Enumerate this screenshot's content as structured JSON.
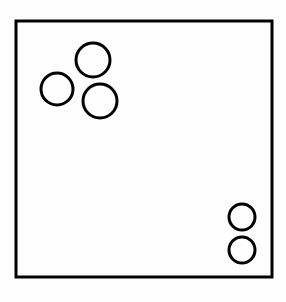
{
  "figure": {
    "canvas": {
      "width": 286,
      "height": 302,
      "background_color": "#fefefe"
    },
    "stroke_color": "#000000",
    "fill_color": "none",
    "container": {
      "shape_name": "square-outline",
      "x": 16,
      "y": 21,
      "width": 256,
      "height": 256,
      "stroke_width": 3
    },
    "groups": [
      {
        "group_name": "upper-left-cluster",
        "count": 3,
        "radius_label": "large"
      },
      {
        "group_name": "lower-right-pair",
        "count": 2,
        "radius_label": "small"
      }
    ],
    "circles": [
      {
        "id": "circle-1",
        "group": "upper-left-cluster",
        "cx": 93,
        "cy": 60,
        "r": 17,
        "stroke_width": 3
      },
      {
        "id": "circle-2",
        "group": "upper-left-cluster",
        "cx": 57,
        "cy": 89,
        "r": 16,
        "stroke_width": 3
      },
      {
        "id": "circle-3",
        "group": "upper-left-cluster",
        "cx": 100,
        "cy": 101,
        "r": 17,
        "stroke_width": 3
      },
      {
        "id": "circle-4",
        "group": "lower-right-pair",
        "cx": 242,
        "cy": 217,
        "r": 13,
        "stroke_width": 3
      },
      {
        "id": "circle-5",
        "group": "lower-right-pair",
        "cx": 242,
        "cy": 250,
        "r": 13,
        "stroke_width": 3
      }
    ],
    "total_circle_count": 5
  }
}
